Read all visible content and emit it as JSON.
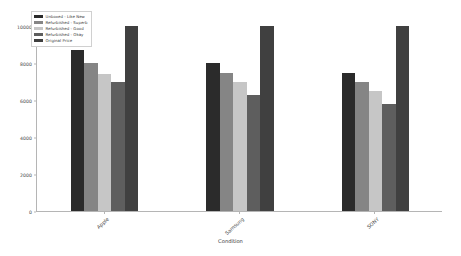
{
  "chart_data": {
    "type": "bar",
    "title": "",
    "xlabel": "Condition",
    "ylabel": "",
    "categories": [
      "Apple",
      "Samsung",
      "SONY"
    ],
    "series": [
      {
        "name": "Unboxed - Like New",
        "color": "#2b2b2b",
        "values": [
          8700,
          8000,
          7500
        ]
      },
      {
        "name": "Refurbished - Superb",
        "color": "#858585",
        "values": [
          8000,
          7500,
          7000
        ]
      },
      {
        "name": "Refurbished - Good",
        "color": "#c6c6c6",
        "values": [
          7400,
          7000,
          6500
        ]
      },
      {
        "name": "Refurbished - Okay",
        "color": "#5e5e5e",
        "values": [
          7000,
          6300,
          5800
        ]
      },
      {
        "name": "Original Price",
        "color": "#404040",
        "values": [
          10000,
          10000,
          10000
        ]
      }
    ],
    "ylim": [
      0,
      10400
    ],
    "yticks": [
      0,
      2000,
      4000,
      6000,
      8000,
      10000
    ],
    "ytick_labels": [
      "0",
      "2000",
      "4000",
      "6000",
      "8000",
      "10000"
    ],
    "grid": false,
    "legend_position": "upper left"
  },
  "axes": {
    "x_title": "Condition"
  }
}
